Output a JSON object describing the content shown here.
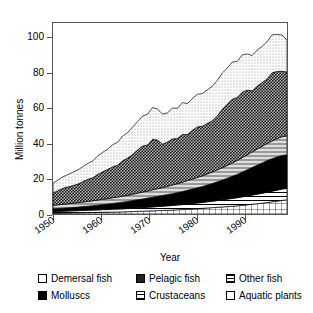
{
  "chart_data": {
    "type": "area",
    "stacked": true,
    "title": "",
    "xlabel": "Year",
    "ylabel": "Million tonnes",
    "xlim": [
      1950,
      1997
    ],
    "ylim": [
      0,
      108
    ],
    "yticks": [
      0,
      20,
      40,
      60,
      80,
      100
    ],
    "xticks": [
      1950,
      1960,
      1970,
      1980,
      1990
    ],
    "xticklabels": [
      "1950",
      "1960",
      "1970",
      "1980",
      "1990"
    ],
    "grid": false,
    "legend_position": "below",
    "stack_order_bottom_to_top": [
      "Aquatic plants",
      "Crustaceans",
      "Molluscs",
      "Other fish",
      "Pelagic fish",
      "Demersal fish"
    ],
    "x": [
      1950,
      1951,
      1952,
      1953,
      1954,
      1955,
      1956,
      1957,
      1958,
      1959,
      1960,
      1961,
      1962,
      1963,
      1964,
      1965,
      1966,
      1967,
      1968,
      1969,
      1970,
      1971,
      1972,
      1973,
      1974,
      1975,
      1976,
      1977,
      1978,
      1979,
      1980,
      1981,
      1982,
      1983,
      1984,
      1985,
      1986,
      1987,
      1988,
      1989,
      1990,
      1991,
      1992,
      1993,
      1994,
      1995,
      1996,
      1997
    ],
    "series": [
      {
        "name": "Aquatic plants",
        "values": [
          0.5,
          0.5,
          0.6,
          0.6,
          0.7,
          0.7,
          0.8,
          0.8,
          0.9,
          0.9,
          1.0,
          1.0,
          1.1,
          1.1,
          1.2,
          1.3,
          1.4,
          1.5,
          1.6,
          1.7,
          1.8,
          1.9,
          2.0,
          2.1,
          2.2,
          2.4,
          2.5,
          2.7,
          2.9,
          3.0,
          3.2,
          3.4,
          3.6,
          3.8,
          4.0,
          4.2,
          4.4,
          4.6,
          4.9,
          5.2,
          5.5,
          5.8,
          6.1,
          6.5,
          6.9,
          7.3,
          7.7,
          8.0
        ]
      },
      {
        "name": "Crustaceans",
        "values": [
          0.9,
          1.0,
          1.0,
          1.1,
          1.1,
          1.2,
          1.2,
          1.3,
          1.3,
          1.4,
          1.5,
          1.5,
          1.6,
          1.7,
          1.7,
          1.8,
          1.9,
          2.0,
          2.0,
          2.1,
          2.2,
          2.3,
          2.4,
          2.5,
          2.6,
          2.7,
          2.8,
          2.9,
          3.0,
          3.2,
          3.3,
          3.5,
          3.6,
          3.8,
          4.0,
          4.2,
          4.4,
          4.6,
          4.8,
          5.0,
          5.2,
          5.4,
          5.6,
          5.8,
          6.0,
          6.2,
          6.4,
          6.5
        ]
      },
      {
        "name": "Molluscs",
        "values": [
          1.5,
          1.6,
          1.7,
          1.8,
          1.9,
          2.0,
          2.2,
          2.3,
          2.5,
          2.7,
          2.9,
          3.1,
          3.3,
          3.5,
          3.8,
          4.0,
          4.3,
          4.6,
          4.9,
          5.2,
          5.5,
          5.8,
          6.1,
          6.4,
          6.7,
          7.0,
          7.4,
          7.8,
          8.2,
          8.6,
          9.0,
          9.5,
          10.0,
          10.6,
          11.2,
          11.8,
          12.5,
          13.2,
          14.0,
          14.8,
          15.6,
          16.4,
          17.2,
          17.9,
          18.4,
          18.8,
          19.0,
          19.0
        ]
      },
      {
        "name": "Other fish",
        "values": [
          2.0,
          2.1,
          2.2,
          2.3,
          2.4,
          2.5,
          2.6,
          2.7,
          2.8,
          2.9,
          3.0,
          3.1,
          3.2,
          3.3,
          3.4,
          3.5,
          3.6,
          3.7,
          3.9,
          4.0,
          4.2,
          4.3,
          4.5,
          4.7,
          4.9,
          5.1,
          5.3,
          5.5,
          5.7,
          5.9,
          6.1,
          6.3,
          6.5,
          6.8,
          7.0,
          7.3,
          7.6,
          7.9,
          8.2,
          8.5,
          8.8,
          9.1,
          9.4,
          9.7,
          10.0,
          10.3,
          10.6,
          10.8
        ]
      },
      {
        "name": "Pelagic fish",
        "values": [
          7.0,
          8.0,
          9.0,
          9.5,
          10.0,
          10.5,
          11.5,
          12.5,
          13.0,
          14.5,
          15.5,
          16.5,
          17.5,
          18.0,
          20.0,
          21.0,
          22.5,
          24.5,
          26.0,
          26.0,
          28.5,
          27.5,
          24.5,
          25.0,
          26.0,
          25.5,
          27.0,
          26.0,
          27.5,
          28.5,
          28.0,
          28.5,
          29.0,
          30.5,
          33.0,
          34.5,
          36.0,
          35.5,
          37.0,
          36.5,
          34.5,
          35.5,
          36.0,
          36.5,
          38.5,
          38.0,
          37.0,
          36.0
        ]
      },
      {
        "name": "Demersal fish",
        "values": [
          5.5,
          6.0,
          6.5,
          7.0,
          7.5,
          8.0,
          8.5,
          9.0,
          9.5,
          10.5,
          11.0,
          11.5,
          12.5,
          13.0,
          14.0,
          14.5,
          15.5,
          16.0,
          17.0,
          17.5,
          18.0,
          17.5,
          17.0,
          16.5,
          17.5,
          17.0,
          18.0,
          17.5,
          18.0,
          18.5,
          18.5,
          19.0,
          19.5,
          20.0,
          20.5,
          20.5,
          21.0,
          20.5,
          21.0,
          20.5,
          20.0,
          20.5,
          20.5,
          21.0,
          21.5,
          21.0,
          20.5,
          18.0
        ]
      }
    ],
    "totals_note": "Total world fisheries production rises from about 17 million tonnes in 1950 to a peak of about 103 million tonnes in the mid 1990s."
  },
  "axes": {
    "ylabel": "Million tonnes",
    "xlabel": "Year",
    "yticks": [
      "0",
      "20",
      "40",
      "60",
      "80",
      "100"
    ],
    "xticks": [
      "1950",
      "1960",
      "1970",
      "1980",
      "1990"
    ]
  },
  "legend": {
    "entries": [
      {
        "label": "Demersal fish",
        "swatch": "demersal-swatch",
        "pattern": "light-dotted"
      },
      {
        "label": "Pelagic fish",
        "swatch": "pelagic-swatch",
        "pattern": "dark-checker"
      },
      {
        "label": "Other fish",
        "swatch": "other-fish-swatch",
        "pattern": "horizontal-hatch"
      },
      {
        "label": "Molluscs",
        "swatch": "molluscs-swatch",
        "pattern": "solid-black"
      },
      {
        "label": "Crustaceans",
        "swatch": "crustaceans-swatch",
        "pattern": "horizontal-lines"
      },
      {
        "label": "Aquatic plants",
        "swatch": "plants-swatch",
        "pattern": "white-grid"
      }
    ]
  },
  "colors": {
    "axis": "#555555",
    "outline": "#000000",
    "pelagic_fill": "#b9b9b9",
    "molluscs_fill": "#000000",
    "background": "#ffffff"
  }
}
